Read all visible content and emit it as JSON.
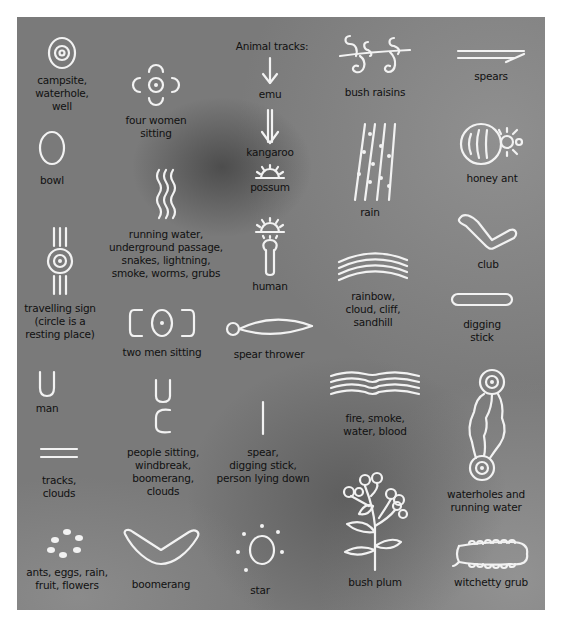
{
  "heading": "Animal tracks:",
  "symbols": [
    {
      "id": "campsite",
      "label": "campsite,\nwaterhole,\nwell",
      "icon": "concentric-circles-icon"
    },
    {
      "id": "four-women",
      "label": "four women\nsitting",
      "icon": "four-women-sitting-icon"
    },
    {
      "id": "emu",
      "label": "emu",
      "icon": "emu-track-icon"
    },
    {
      "id": "bush-raisins",
      "label": "bush raisins",
      "icon": "bush-raisins-icon"
    },
    {
      "id": "spears",
      "label": "spears",
      "icon": "spears-icon"
    },
    {
      "id": "kangaroo",
      "label": "kangaroo",
      "icon": "kangaroo-track-icon"
    },
    {
      "id": "possum",
      "label": "possum",
      "icon": "possum-track-icon"
    },
    {
      "id": "bowl",
      "label": "bowl",
      "icon": "bowl-icon"
    },
    {
      "id": "rain",
      "label": "rain",
      "icon": "rain-icon"
    },
    {
      "id": "honey-ant",
      "label": "honey ant",
      "icon": "honey-ant-icon"
    },
    {
      "id": "running-water",
      "label": "running water,\nunderground passage,\nsnakes, lightning,\nsmoke, worms, grubs",
      "icon": "wavy-lines-icon"
    },
    {
      "id": "human",
      "label": "human",
      "icon": "human-icon"
    },
    {
      "id": "club",
      "label": "club",
      "icon": "club-icon"
    },
    {
      "id": "travelling-sign",
      "label": "travelling sign\n(circle is a\nresting place)",
      "icon": "travelling-sign-icon"
    },
    {
      "id": "rainbow",
      "label": "rainbow,\ncloud, cliff,\nsandhill",
      "icon": "rainbow-icon"
    },
    {
      "id": "two-men",
      "label": "two men sitting",
      "icon": "two-men-sitting-icon"
    },
    {
      "id": "spear-thrower",
      "label": "spear thrower",
      "icon": "spear-thrower-icon"
    },
    {
      "id": "digging-stick",
      "label": "digging\nstick",
      "icon": "digging-stick-icon"
    },
    {
      "id": "man",
      "label": "man",
      "icon": "man-icon"
    },
    {
      "id": "people-sitting",
      "label": "people sitting,\nwindbreak,\nboomerang,\nclouds",
      "icon": "people-sitting-icon"
    },
    {
      "id": "spear",
      "label": "spear,\ndigging stick,\nperson lying down",
      "icon": "spear-line-icon"
    },
    {
      "id": "fire",
      "label": "fire, smoke,\nwater, blood",
      "icon": "fire-smoke-icon"
    },
    {
      "id": "waterholes",
      "label": "waterholes and\nrunning water",
      "icon": "waterholes-running-water-icon"
    },
    {
      "id": "tracks",
      "label": "tracks,\nclouds",
      "icon": "tracks-icon"
    },
    {
      "id": "ants",
      "label": "ants, eggs, rain,\nfruit, flowers",
      "icon": "dots-icon"
    },
    {
      "id": "boomerang",
      "label": "boomerang",
      "icon": "boomerang-icon"
    },
    {
      "id": "star",
      "label": "star",
      "icon": "star-icon"
    },
    {
      "id": "bush-plum",
      "label": "bush plum",
      "icon": "bush-plum-icon"
    },
    {
      "id": "witchetty-grub",
      "label": "witchetty grub",
      "icon": "witchetty-grub-icon"
    }
  ]
}
